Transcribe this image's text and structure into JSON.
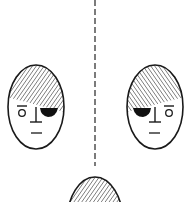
{
  "figure": {
    "colors": {
      "line": "#1a1a1a",
      "background": "#ffffff",
      "hatch": "#2a2a2a"
    },
    "axis": {
      "style": "dashed",
      "x": 95
    },
    "faces": [
      {
        "id": "left-face",
        "cx": 36,
        "cy": 107,
        "patch_side": "right"
      },
      {
        "id": "right-face",
        "cx": 155,
        "cy": 107,
        "patch_side": "left"
      },
      {
        "id": "bottom-face",
        "cx": 95,
        "cy": 222,
        "partial": true
      }
    ]
  }
}
